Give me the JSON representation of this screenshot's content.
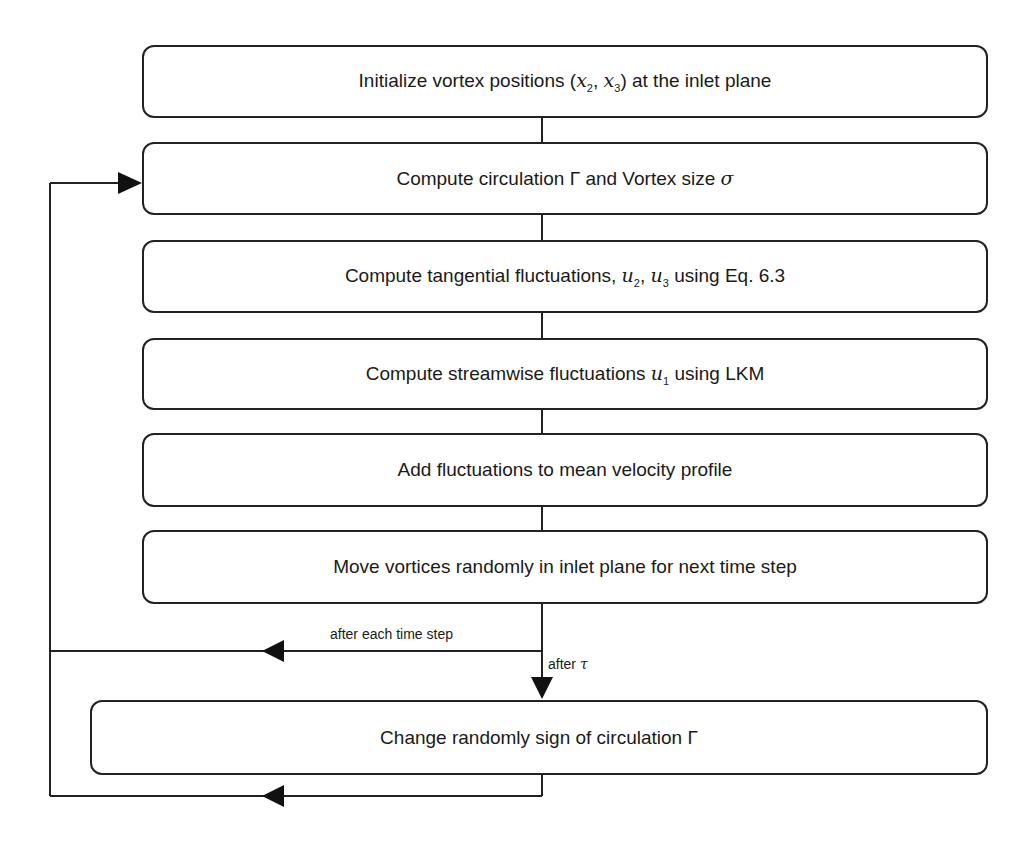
{
  "flowchart": {
    "steps": [
      {
        "id": "init",
        "parts": [
          "Initialize vortex positions (",
          "x",
          "2",
          ", ",
          "x",
          "3",
          ") at the inlet plane"
        ]
      },
      {
        "id": "circulation",
        "parts": [
          "Compute circulation ",
          "Γ",
          " and Vortex size ",
          "σ"
        ]
      },
      {
        "id": "tangential",
        "parts": [
          "Compute tangential fluctuations, ",
          "u",
          "2",
          ", ",
          "u",
          "3",
          " using Eq. 6.3"
        ]
      },
      {
        "id": "streamwise",
        "parts": [
          "Compute streamwise fluctuations ",
          "u",
          "1",
          " using LKM"
        ]
      },
      {
        "id": "add",
        "text": "Add fluctuations to mean velocity profile"
      },
      {
        "id": "move",
        "text": "Move vortices randomly in inlet plane for next time step"
      },
      {
        "id": "change-sign",
        "parts": [
          "Change randomly sign of circulation ",
          "Γ"
        ]
      }
    ],
    "edges": {
      "loop_label": "after each time step",
      "tau_label_prefix": "after ",
      "tau_symbol": "τ"
    },
    "colors": {
      "line": "#222222",
      "background": "#ffffff"
    }
  }
}
